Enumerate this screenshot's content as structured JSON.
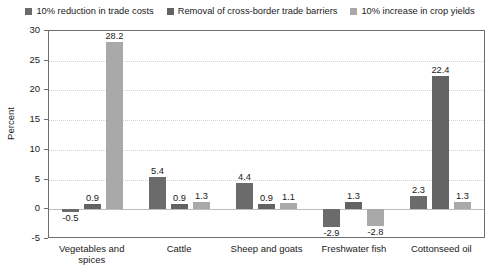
{
  "chart_data": {
    "type": "bar",
    "title": "",
    "xlabel": "",
    "ylabel": "Percent",
    "ylim": [
      -5,
      30
    ],
    "ytick_step": 5,
    "yticks": [
      "30",
      "25",
      "20",
      "15",
      "10",
      "5",
      "0",
      "-5"
    ],
    "grid": true,
    "legend_position": "top-center",
    "categories": [
      "Vegetables and spices",
      "Cattle",
      "Sheep and goats",
      "Freshwater fish",
      "Cottonseed oil"
    ],
    "series": [
      {
        "name": "10% reduction in trade costs",
        "color": "#6b6b6b",
        "values": [
          -0.5,
          5.4,
          4.4,
          -2.9,
          2.3
        ],
        "labels": [
          "-0.5",
          "5.4",
          "4.4",
          "-2.9",
          "2.3"
        ]
      },
      {
        "name": "Removal of cross-border trade barriers",
        "color": "#636363",
        "values": [
          0.9,
          0.9,
          0.9,
          1.3,
          22.4
        ],
        "labels": [
          "0.9",
          "0.9",
          "0.9",
          "1.3",
          "22.4"
        ]
      },
      {
        "name": "10% increase in crop yields",
        "color": "#a9a9a9",
        "values": [
          28.2,
          1.3,
          1.1,
          -2.8,
          1.3
        ],
        "labels": [
          "28.2",
          "1.3",
          "1.1",
          "-2.8",
          "1.3"
        ]
      }
    ]
  },
  "legend": {
    "items": [
      {
        "label": "10% reduction in trade costs",
        "color": "#6b6b6b"
      },
      {
        "label": "Removal of cross-border trade barriers",
        "color": "#636363"
      },
      {
        "label": "10% increase in crop yields",
        "color": "#a9a9a9"
      }
    ]
  },
  "axes": {
    "y_title": "Percent"
  },
  "colors": {
    "frame": "#6e6e6e",
    "gridline": "#d2d2d2",
    "zeroline": "#bdbdbd",
    "text": "#1a1a1a",
    "background": "#ffffff"
  }
}
